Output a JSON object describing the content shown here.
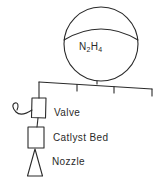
{
  "diagram": {
    "tank": {
      "label_parts": {
        "n": "N",
        "n_count": "2",
        "h": "H",
        "h_count": "4"
      }
    },
    "components": {
      "valve": "Valve",
      "catalyst_bed": "Catlyst Bed",
      "nozzle": "Nozzle"
    },
    "colors": {
      "stroke": "#2a2a2a",
      "background": "#ffffff"
    }
  }
}
